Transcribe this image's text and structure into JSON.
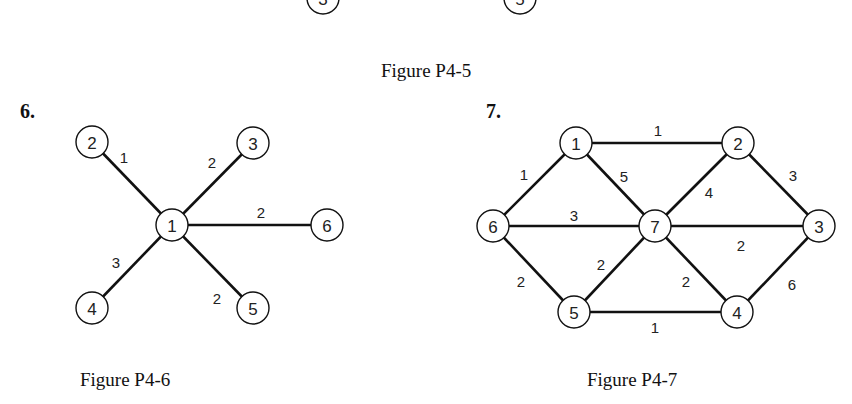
{
  "figure_p4_5": {
    "caption": "Figure P4-5",
    "nodes": [
      {
        "id": "3",
        "x": 323,
        "y": -2
      },
      {
        "id": "5",
        "x": 520,
        "y": -2
      }
    ],
    "edges": [
      {
        "from": "3",
        "to": "5",
        "weight": ""
      }
    ]
  },
  "problem_6": {
    "number": "6.",
    "caption": "Figure P4-6",
    "nodes": [
      {
        "id": "1",
        "x": 172,
        "y": 225
      },
      {
        "id": "2",
        "x": 92,
        "y": 142
      },
      {
        "id": "3",
        "x": 253,
        "y": 143
      },
      {
        "id": "4",
        "x": 92,
        "y": 308
      },
      {
        "id": "5",
        "x": 253,
        "y": 308
      },
      {
        "id": "6",
        "x": 327,
        "y": 225
      }
    ],
    "edges": [
      {
        "from": "1",
        "to": "2",
        "weight": "1",
        "lx": 124,
        "ly": 157
      },
      {
        "from": "1",
        "to": "3",
        "weight": "2",
        "lx": 212,
        "ly": 162
      },
      {
        "from": "1",
        "to": "6",
        "weight": "2",
        "lx": 261,
        "ly": 212
      },
      {
        "from": "1",
        "to": "4",
        "weight": "3",
        "lx": 116,
        "ly": 262
      },
      {
        "from": "1",
        "to": "5",
        "weight": "2",
        "lx": 217,
        "ly": 298
      }
    ]
  },
  "problem_7": {
    "number": "7.",
    "caption": "Figure P4-7",
    "nodes": [
      {
        "id": "1",
        "x": 576,
        "y": 143
      },
      {
        "id": "2",
        "x": 738,
        "y": 143
      },
      {
        "id": "3",
        "x": 819,
        "y": 226
      },
      {
        "id": "4",
        "x": 737,
        "y": 312
      },
      {
        "id": "5",
        "x": 574,
        "y": 312
      },
      {
        "id": "6",
        "x": 493,
        "y": 226
      },
      {
        "id": "7",
        "x": 655,
        "y": 226
      }
    ],
    "edges": [
      {
        "from": "1",
        "to": "2",
        "weight": "1",
        "lx": 658,
        "ly": 130
      },
      {
        "from": "1",
        "to": "6",
        "weight": "1",
        "lx": 524,
        "ly": 174
      },
      {
        "from": "1",
        "to": "7",
        "weight": "5",
        "lx": 624,
        "ly": 176
      },
      {
        "from": "2",
        "to": "7",
        "weight": "4",
        "lx": 709,
        "ly": 192
      },
      {
        "from": "2",
        "to": "3",
        "weight": "3",
        "lx": 793,
        "ly": 175
      },
      {
        "from": "6",
        "to": "7",
        "weight": "3",
        "lx": 574,
        "ly": 215
      },
      {
        "from": "7",
        "to": "3",
        "weight": "2",
        "lx": 741,
        "ly": 245
      },
      {
        "from": "6",
        "to": "5",
        "weight": "2",
        "lx": 521,
        "ly": 281
      },
      {
        "from": "5",
        "to": "7",
        "weight": "2",
        "lx": 601,
        "ly": 264
      },
      {
        "from": "7",
        "to": "4",
        "weight": "2",
        "lx": 686,
        "ly": 281
      },
      {
        "from": "3",
        "to": "4",
        "weight": "6",
        "lx": 792,
        "ly": 284
      },
      {
        "from": "5",
        "to": "4",
        "weight": "1",
        "lx": 655,
        "ly": 327
      }
    ]
  }
}
